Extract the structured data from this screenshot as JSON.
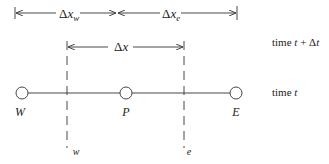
{
  "diagram": {
    "type": "finite-volume-1d-grid",
    "colors": {
      "stroke": "#333333",
      "text": "#222222",
      "background": "#ffffff"
    },
    "dimensions": {
      "dx_w": {
        "delta": "Δ",
        "var": "x",
        "sub": "w"
      },
      "dx_e": {
        "delta": "Δ",
        "var": "x",
        "sub": "e"
      },
      "dx": {
        "delta": "Δ",
        "var": "x"
      }
    },
    "nodes": [
      {
        "id": "W",
        "label": "W"
      },
      {
        "id": "P",
        "label": "P"
      },
      {
        "id": "E",
        "label": "E"
      }
    ],
    "faces": [
      {
        "id": "w",
        "label": "w"
      },
      {
        "id": "e",
        "label": "e"
      }
    ],
    "time_levels": {
      "upper": {
        "prefix": "time ",
        "t": "t",
        "plus": " + Δ",
        "dt": "t"
      },
      "lower": {
        "prefix": "time ",
        "t": "t"
      }
    }
  }
}
